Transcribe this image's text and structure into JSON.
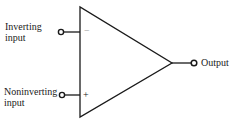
{
  "diagram": {
    "inputs": [
      {
        "label_line1": "Inverting",
        "label_line2": "input",
        "sign": "−"
      },
      {
        "label_line1": "Noninverting",
        "label_line2": "input",
        "sign": "+"
      }
    ],
    "output": {
      "label": "Output"
    },
    "colors": {
      "stroke": "#1a1a1a",
      "background": "#ffffff"
    }
  }
}
